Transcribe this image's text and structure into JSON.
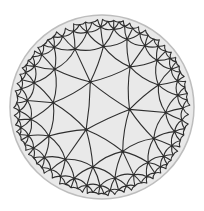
{
  "figure": {
    "tiling": {
      "p": 3,
      "q": 7,
      "centered_on": "face",
      "rotation_deg": 5
    },
    "disk": {
      "cx": 102,
      "cy": 107,
      "r": 92
    },
    "colors": {
      "background": "#ffffff",
      "disk_fill": "#e9e9e9",
      "edge": "#2e2e2e",
      "rim": "#bdbdbd"
    },
    "max_depth": 7
  }
}
